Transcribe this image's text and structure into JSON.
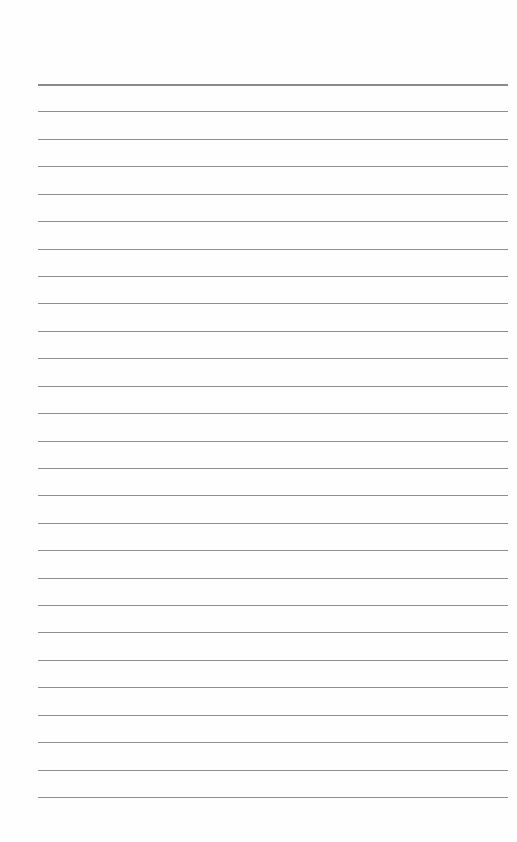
{
  "page": {
    "type": "ruled-paper",
    "line_count": 27,
    "first_line_y": 84,
    "last_line_y": 797,
    "line_left_x": 38,
    "line_right_x": 508,
    "line_color": "#8f8f8f",
    "background_color": "#fefefe"
  }
}
